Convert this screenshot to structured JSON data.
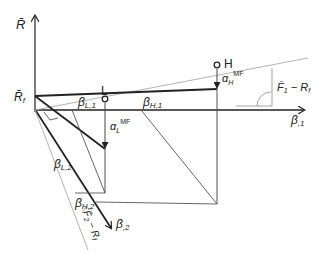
{
  "diagram": {
    "axes": {
      "vertical_label": "R̄",
      "origin_label": "R̄",
      "origin_label_sub": "f",
      "axis1_label": "β",
      "axis1_sub": ",1",
      "axis2_label": "β",
      "axis2_sub": ",2"
    },
    "points": {
      "low": {
        "label": "L",
        "alpha": "α",
        "alpha_sub": "L",
        "alpha_sup": "MF"
      },
      "high": {
        "label": "H",
        "alpha": "α",
        "alpha_sub": "H",
        "alpha_sup": "MF"
      }
    },
    "betas": {
      "L1": {
        "label": "β",
        "sub": "L,1"
      },
      "H1": {
        "label": "β",
        "sub": "H,1"
      },
      "L2": {
        "label": "β",
        "sub": "L,2"
      },
      "H2": {
        "label": "β",
        "sub": "H,2"
      }
    },
    "slopes": {
      "slope1": {
        "text": "F̄",
        "sub": "1",
        "rest": " − R",
        "rest_sub": "f"
      },
      "slope2": {
        "text": "F̄",
        "sub": "2",
        "rest": " − R",
        "rest_sub": "f"
      }
    },
    "colors": {
      "main": "#222222",
      "thin": "#555555",
      "light": "#aaaaaa"
    }
  }
}
